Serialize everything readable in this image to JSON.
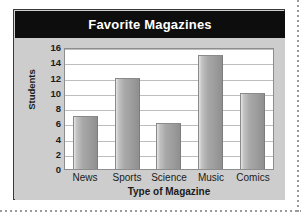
{
  "chart_data": {
    "type": "bar",
    "title": "Favorite Magazines",
    "xlabel": "Type of Magazine",
    "ylabel": "Students",
    "categories": [
      "News",
      "Sports",
      "Science",
      "Music",
      "Comics"
    ],
    "values": [
      7,
      12,
      6,
      15,
      10
    ],
    "ylim": [
      0,
      16
    ],
    "ytick_labels": [
      "16",
      "14",
      "12",
      "10",
      "8",
      "6",
      "4",
      "2",
      "0"
    ],
    "yticks": [
      16,
      14,
      12,
      10,
      8,
      6,
      4,
      2,
      0
    ],
    "grid": true,
    "legend": false,
    "colors": {
      "title_banner_background": "#0d0d0d",
      "title_text": "#ffffff",
      "card_background": "#cdcdcd",
      "card_border": "#3a3a3a",
      "plot_background": "#ffffff",
      "gridline": "#bdbdbd",
      "bar_fill_light": "#e4e4e4",
      "bar_fill_dark": "#8f8f8f",
      "axis_text": "#1b1b1b"
    }
  }
}
